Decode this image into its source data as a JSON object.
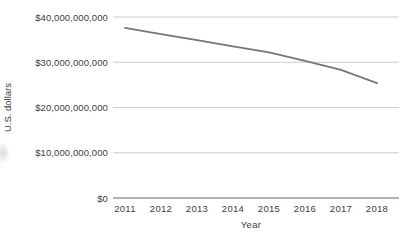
{
  "chart_data": {
    "type": "line",
    "title": "",
    "xlabel": "Year",
    "ylabel": "U.S. dollars",
    "categories": [
      2011,
      2012,
      2013,
      2014,
      2015,
      2016,
      2017,
      2018
    ],
    "series": [
      {
        "name": "U.S. dollars",
        "values": [
          37600000000,
          36200000000,
          34900000000,
          33500000000,
          32200000000,
          30300000000,
          28300000000,
          25400000000
        ]
      }
    ],
    "ylim": [
      0,
      40000000000
    ],
    "ytick_values": [
      0,
      10000000000,
      20000000000,
      30000000000,
      40000000000
    ],
    "ytick_labels": [
      "$0",
      "$10,000,000,000",
      "$20,000,000,000",
      "$30,000,000,000",
      "$40,000,000,000"
    ],
    "grid": true,
    "legend_position": "none",
    "colors": {
      "line": "#767676",
      "gridline": "#cbcbcb",
      "axis_line": "#9a9a9a",
      "text": "#3d3d3d",
      "background": "#ffffff"
    }
  }
}
